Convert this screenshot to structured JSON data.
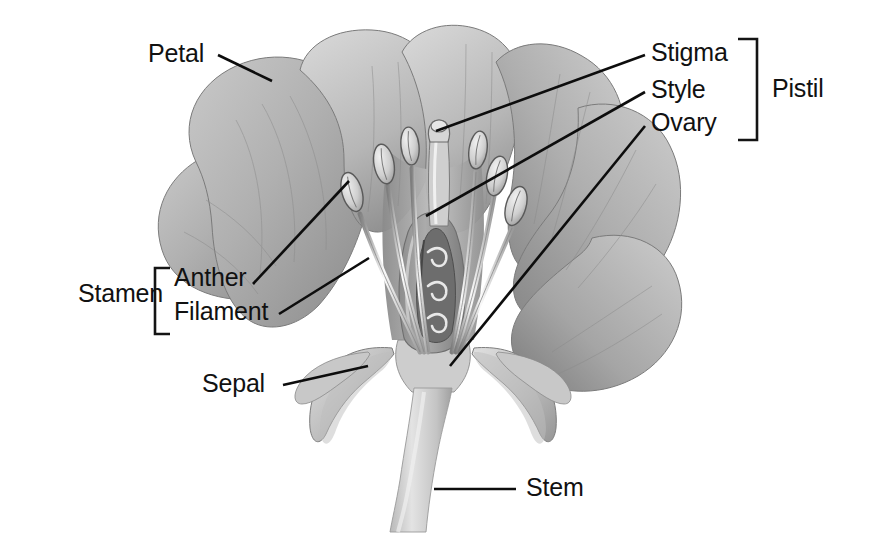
{
  "figure": {
    "style": "grayscale pencil illustration",
    "background_color": "#ffffff",
    "label_color": "#111111",
    "leader_line_color": "#0d0d0d"
  },
  "labels": {
    "petal": "Petal",
    "stigma": "Stigma",
    "style": "Style",
    "ovary": "Ovary",
    "pistil": "Pistil",
    "stamen": "Stamen",
    "anther": "Anther",
    "filament": "Filament",
    "sepal": "Sepal",
    "stem": "Stem"
  },
  "groups": [
    {
      "name": "Pistil",
      "bracket": "right",
      "members": [
        "Stigma",
        "Style",
        "Ovary"
      ]
    },
    {
      "name": "Stamen",
      "bracket": "left",
      "members": [
        "Anther",
        "Filament"
      ]
    }
  ],
  "parts": [
    {
      "id": "petal",
      "label": "Petal",
      "side": "left"
    },
    {
      "id": "stigma",
      "label": "Stigma",
      "side": "right"
    },
    {
      "id": "style",
      "label": "Style",
      "side": "right"
    },
    {
      "id": "ovary",
      "label": "Ovary",
      "side": "right"
    },
    {
      "id": "anther",
      "label": "Anther",
      "side": "left"
    },
    {
      "id": "filament",
      "label": "Filament",
      "side": "left"
    },
    {
      "id": "sepal",
      "label": "Sepal",
      "side": "left"
    },
    {
      "id": "stem",
      "label": "Stem",
      "side": "right"
    }
  ],
  "colors": {
    "petal_light": "#d9d9d9",
    "petal_mid": "#b5b5b5",
    "petal_dark": "#8f8f8f",
    "petal_shadow": "#6f6f6f",
    "filament_light": "#f2f2f2",
    "anther_outline": "#5a5a5a",
    "ovary_wall": "#9a9a9a",
    "ovule_dark": "#4a4a4a",
    "sepal": "#c4c4c4",
    "stem": "#cfcfcf"
  }
}
